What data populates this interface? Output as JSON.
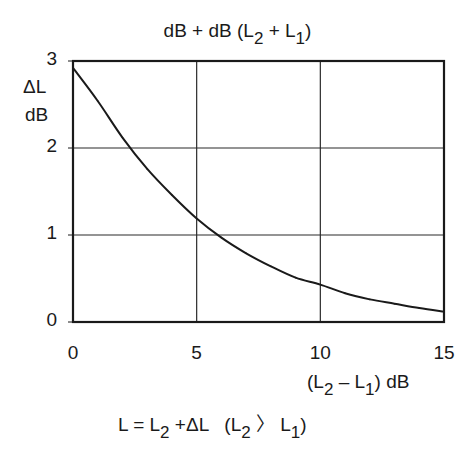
{
  "chart_data": {
    "type": "line",
    "title_parts": {
      "prefix": "dB + dB (L",
      "sub1": "2",
      "mid": " + L",
      "sub2": "1",
      "suffix": ")"
    },
    "title": "dB + dB (L2 + L1)",
    "ylabel": [
      "ΔL",
      "dB"
    ],
    "xlabel_parts": {
      "prefix": "(L",
      "sub1": "2",
      "mid": " – L",
      "sub2": "1",
      "suffix": ") dB"
    },
    "xlabel": "(L2 – L1) dB",
    "xlim": [
      0,
      15
    ],
    "ylim": [
      0,
      3
    ],
    "xticks": [
      "0",
      "5",
      "10",
      "15"
    ],
    "xtick_values": [
      0,
      5,
      10,
      15
    ],
    "yticks": [
      "0",
      "1",
      "2",
      "3"
    ],
    "ytick_values": [
      0,
      1,
      2,
      3
    ],
    "grid": true,
    "legend": "none",
    "series": [
      {
        "name": "ΔL",
        "x": [
          0,
          1,
          2,
          3,
          4,
          5,
          6,
          7,
          8,
          9,
          10,
          11,
          12,
          13,
          14,
          15
        ],
        "y": [
          2.92,
          2.54,
          2.12,
          1.76,
          1.46,
          1.19,
          0.97,
          0.79,
          0.64,
          0.51,
          0.43,
          0.33,
          0.26,
          0.21,
          0.16,
          0.12
        ]
      }
    ],
    "annotation_parts": {
      "a": "L = L",
      "s1": "2",
      "b": " +ΔL   (L",
      "s2": "2",
      "c": " 〉 L",
      "s3": "1",
      "d": ")"
    },
    "annotation": "L = L2 + ΔL   (L2 > L1)"
  },
  "colors": {
    "line": "#1a1a1a",
    "grid": "#2a2a2a",
    "frame": "#1a1a1a"
  }
}
